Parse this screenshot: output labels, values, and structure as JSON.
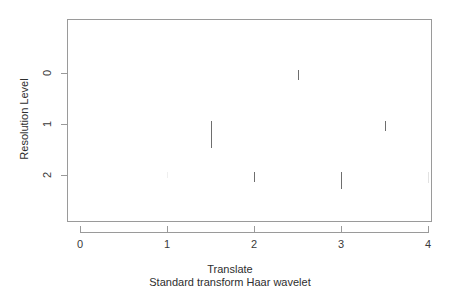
{
  "chart_data": {
    "type": "scatter",
    "title": "",
    "subtitle": "Standard transform Haar wavelet",
    "xlabel": "Translate",
    "ylabel": "Resolution Level",
    "xlim": [
      -0.15,
      4.15
    ],
    "ylim": [
      2.6,
      -0.55
    ],
    "xticks": [
      0,
      1,
      2,
      3,
      4
    ],
    "xticklabels": [
      "0",
      "1",
      "2",
      "3",
      "4"
    ],
    "yticks": [
      0,
      1,
      2
    ],
    "yticklabels": [
      "0",
      "1",
      "2"
    ],
    "grid": false,
    "legend": false,
    "series": [
      {
        "name": "Resolution Level 0",
        "level": 0,
        "baseline_y": 73,
        "points": [
          {
            "translate": 2.5,
            "magnitude": 0.195,
            "visibility": "solid"
          }
        ]
      },
      {
        "name": "Resolution Level 1",
        "level": 1,
        "baseline_y": 124,
        "points": [
          {
            "translate": 1.5,
            "magnitude": 0.53,
            "visibility": "solid"
          },
          {
            "translate": 3.5,
            "magnitude": 0.2,
            "visibility": "solid"
          }
        ]
      },
      {
        "name": "Resolution Level 2",
        "level": 2,
        "baseline_y": 175,
        "points": [
          {
            "translate": 1.0,
            "magnitude": 0.12,
            "visibility": "very-faint"
          },
          {
            "translate": 2.0,
            "magnitude": 0.2,
            "visibility": "solid"
          },
          {
            "translate": 3.0,
            "magnitude": 0.34,
            "visibility": "solid"
          },
          {
            "translate": 4.0,
            "magnitude": 0.21,
            "visibility": "faint"
          }
        ]
      }
    ]
  },
  "axis": {
    "y_title": "Resolution Level",
    "x_title": "Translate",
    "x_subtitle": "Standard transform Haar wavelet",
    "x_tick_labels": [
      "0",
      "1",
      "2",
      "3",
      "4"
    ],
    "y_tick_labels": [
      "0",
      "1",
      "2"
    ]
  },
  "colors": {
    "axis": "#9a9a9a",
    "mark": "#6e6e6e",
    "mark_faint": "#e2e2e2",
    "text": "#2e2e2e",
    "background": "#ffffff"
  }
}
